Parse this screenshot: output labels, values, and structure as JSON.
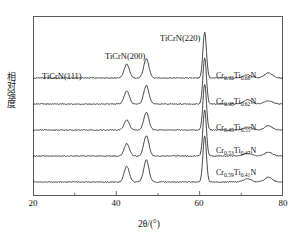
{
  "figure": {
    "ylabel": "相对强度",
    "xlabel_html": "2&#952;/(&#176;)",
    "xlabel_plain": "2θ/(°)"
  },
  "axes": {
    "x_ticks_major": [
      "20",
      "40",
      "60",
      "80"
    ],
    "x_tick_values": [
      20,
      40,
      60,
      80
    ],
    "x_minor_ticks": [
      30,
      50,
      70
    ],
    "x_range": [
      20,
      80
    ],
    "y_ticks": [],
    "frame": true,
    "grid": false
  },
  "annotations": {
    "peak_111": "TiCrN(111)",
    "peak_200": "TiCrN(200)",
    "peak_220": "TiCrN(220)"
  },
  "curves": [
    {
      "label_html": "Cr<sub>0.32</sub>Ti<sub>0.68</sub>N",
      "label_plain": "Cr0.32Ti0.68N"
    },
    {
      "label_html": "Cr<sub>0.38</sub>Ti<sub>0.62</sub>N",
      "label_plain": "Cr0.38Ti0.62N"
    },
    {
      "label_html": "Cr<sub>0.45</sub>Ti<sub>0.55</sub>N",
      "label_plain": "Cr0.45Ti0.55N"
    },
    {
      "label_html": "Cr<sub>0.53</sub>Ti<sub>0.47</sub>N",
      "label_plain": "Cr0.53Ti0.47N"
    },
    {
      "label_html": "Cr<sub>0.59</sub>Ti<sub>0.41</sub>N",
      "label_plain": "Cr0.59Ti0.41N"
    }
  ],
  "colors": {
    "line": "#1a1a1a",
    "frame": "#5a5a5a",
    "background": "#ffffff",
    "text": "#111111"
  },
  "chart_data": {
    "type": "line",
    "title": "",
    "xlabel": "2θ/(°)",
    "ylabel": "相对强度",
    "xlim": [
      20,
      80
    ],
    "ylim": [
      0,
      1
    ],
    "grid": false,
    "legend_position": "inline-right",
    "x_unit": "degree",
    "note": "XRD diffraction patterns of TiCrN coatings, five stacked (offset) traces",
    "peak_assignments": [
      {
        "name": "TiCrN(111)",
        "two_theta": 42.5
      },
      {
        "name": "TiCrN(200)",
        "two_theta": 47.2
      },
      {
        "name": "TiCrN(220)",
        "two_theta": 61.2
      }
    ],
    "series": [
      {
        "name": "Cr0.32Ti0.68N",
        "baseline_offset_index": 0,
        "peaks": [
          {
            "two_theta": 42.5,
            "rel_intensity": 0.3
          },
          {
            "two_theta": 47.2,
            "rel_intensity": 0.42
          },
          {
            "two_theta": 61.2,
            "rel_intensity": 1.0
          },
          {
            "two_theta": 71.5,
            "rel_intensity": 0.07
          },
          {
            "two_theta": 76.5,
            "rel_intensity": 0.11
          }
        ]
      },
      {
        "name": "Cr0.38Ti0.62N",
        "baseline_offset_index": 1,
        "peaks": [
          {
            "two_theta": 42.5,
            "rel_intensity": 0.28
          },
          {
            "two_theta": 47.2,
            "rel_intensity": 0.4
          },
          {
            "two_theta": 61.2,
            "rel_intensity": 1.0
          },
          {
            "two_theta": 71.5,
            "rel_intensity": 0.09
          },
          {
            "two_theta": 76.5,
            "rel_intensity": 0.07
          }
        ]
      },
      {
        "name": "Cr0.45Ti0.55N",
        "baseline_offset_index": 2,
        "peaks": [
          {
            "two_theta": 42.5,
            "rel_intensity": 0.22
          },
          {
            "two_theta": 47.2,
            "rel_intensity": 0.38
          },
          {
            "two_theta": 61.2,
            "rel_intensity": 1.0
          },
          {
            "two_theta": 71.5,
            "rel_intensity": 0.06
          },
          {
            "two_theta": 76.5,
            "rel_intensity": 0.09
          }
        ]
      },
      {
        "name": "Cr0.53Ti0.47N",
        "baseline_offset_index": 3,
        "peaks": [
          {
            "two_theta": 42.5,
            "rel_intensity": 0.27
          },
          {
            "two_theta": 47.2,
            "rel_intensity": 0.44
          },
          {
            "two_theta": 61.2,
            "rel_intensity": 1.0
          },
          {
            "two_theta": 71.5,
            "rel_intensity": 0.06
          },
          {
            "two_theta": 76.5,
            "rel_intensity": 0.08
          }
        ]
      },
      {
        "name": "Cr0.59Ti0.41N",
        "baseline_offset_index": 4,
        "peaks": [
          {
            "two_theta": 42.5,
            "rel_intensity": 0.34
          },
          {
            "two_theta": 47.2,
            "rel_intensity": 0.48
          },
          {
            "two_theta": 61.2,
            "rel_intensity": 1.0
          },
          {
            "two_theta": 71.5,
            "rel_intensity": 0.07
          },
          {
            "two_theta": 76.5,
            "rel_intensity": 0.1
          }
        ]
      }
    ]
  }
}
